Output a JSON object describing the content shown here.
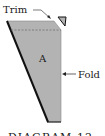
{
  "diagram": {
    "labels": {
      "trim": "Trim",
      "fold": "Fold",
      "region": "A",
      "caption": "DIAGRAM 12"
    },
    "colors": {
      "panel_fill": "#b3b3b3",
      "outline": "#111111",
      "dashed_line": "#6e6e6e",
      "text": "#1a1a1a"
    }
  }
}
